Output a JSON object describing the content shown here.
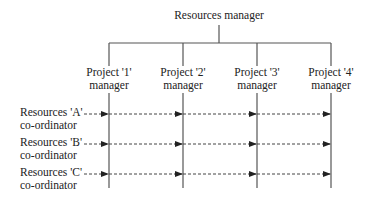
{
  "root": {
    "label": "Resources manager"
  },
  "projects": [
    {
      "line1": "Project '1'",
      "line2": "manager"
    },
    {
      "line1": "Project '2'",
      "line2": "manager"
    },
    {
      "line1": "Project '3'",
      "line2": "manager"
    },
    {
      "line1": "Project '4'",
      "line2": "manager"
    }
  ],
  "coordinators": [
    {
      "line1": "Resources 'A'",
      "line2": "co-ordinator"
    },
    {
      "line1": "Resources 'B'",
      "line2": "co-ordinator"
    },
    {
      "line1": "Resources 'C'",
      "line2": "co-ordinator"
    }
  ],
  "colors": {
    "line": "#555555",
    "text": "#222222"
  }
}
